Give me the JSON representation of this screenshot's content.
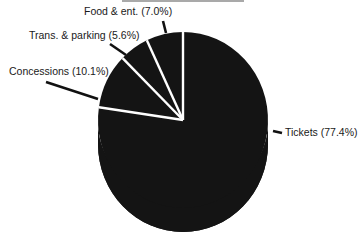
{
  "chart_data": {
    "type": "pie",
    "title": "",
    "style": "3d",
    "categories": [
      "Tickets",
      "Concessions",
      "Trans. & parking",
      "Food & ent."
    ],
    "values": [
      77.4,
      10.1,
      5.6,
      7.0
    ],
    "labels": [
      "Tickets (77.4%)",
      "Concessions (10.1%)",
      "Trans. & parking (5.6%)",
      "Food & ent. (7.0%)"
    ],
    "start_angle_deg": 0,
    "direction": "clockwise",
    "colors": {
      "slice_fill": "#141414",
      "separator": "#ffffff",
      "label_text": "#1a1a1a",
      "leader": "#111111"
    },
    "legend": "none (direct labels with leader lines)"
  }
}
